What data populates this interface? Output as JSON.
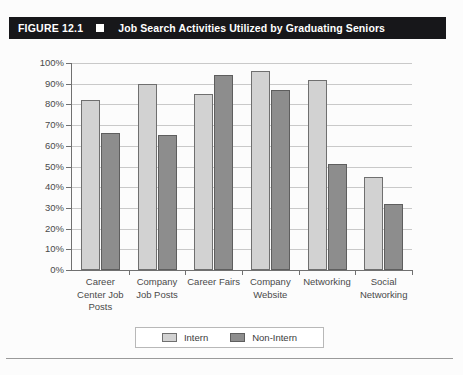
{
  "figure": {
    "label": "FIGURE 12.1",
    "marker_icon": "filled-square-icon",
    "title": "Job Search Activities Utilized by Graduating Seniors"
  },
  "colors": {
    "title_bar_bg": "#17171a",
    "title_text": "#ffffff",
    "intern_fill": "#d2d2d2",
    "nonintern_fill": "#8d8d8d",
    "bar_outline": "#6f6f6f",
    "gridline": "#c9c9c9",
    "axis": "#707070"
  },
  "chart_data": {
    "type": "bar",
    "title": "Job Search Activities Utilized by Graduating Seniors",
    "xlabel": "",
    "ylabel": "",
    "ylim": [
      0,
      100
    ],
    "grid": true,
    "legend_position": "bottom",
    "yticks": [
      "0%",
      "10%",
      "20%",
      "30%",
      "40%",
      "50%",
      "60%",
      "70%",
      "80%",
      "90%",
      "100%"
    ],
    "ytick_values": [
      0,
      10,
      20,
      30,
      40,
      50,
      60,
      70,
      80,
      90,
      100
    ],
    "categories": [
      "Career Center Job Posts",
      "Company Job Posts",
      "Career Fairs",
      "Company Website",
      "Networking",
      "Social Networking"
    ],
    "series": [
      {
        "name": "Intern",
        "values": [
          82,
          90,
          85,
          96,
          92,
          45
        ]
      },
      {
        "name": "Non-Intern",
        "values": [
          66,
          65,
          94,
          87,
          51,
          32
        ]
      }
    ]
  },
  "legend": {
    "items": [
      {
        "label": "Intern"
      },
      {
        "label": "Non-Intern"
      }
    ]
  }
}
